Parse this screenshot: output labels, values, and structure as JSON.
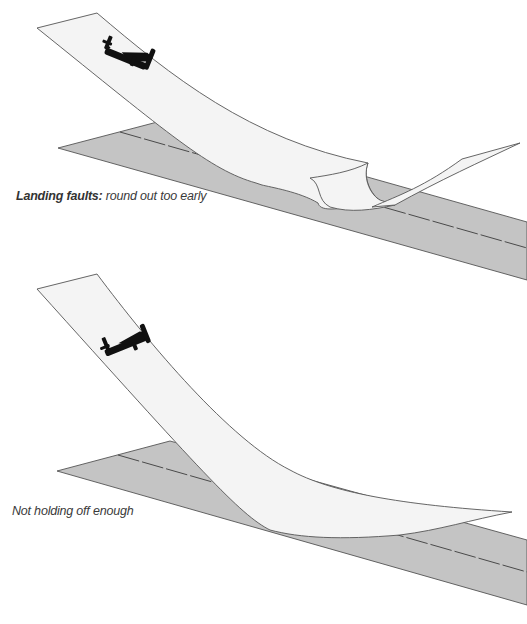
{
  "figures": [
    {
      "id": "round-out-too-early",
      "caption_lead": "Landing faults:",
      "caption_text": " round out too early"
    },
    {
      "id": "not-holding-off",
      "caption_lead": "",
      "caption_text": "Not holding off enough"
    }
  ],
  "colors": {
    "runway_fill": "#c4c4c4",
    "runway_edge": "#555555",
    "ribbon_fill": "#f4f4f4",
    "ribbon_edge": "#555555",
    "centerline": "#4a4a4a",
    "aircraft": "#111111",
    "caption": "#3a3a3a"
  },
  "icons": {
    "aircraft": "airplane-silhouette-icon"
  }
}
